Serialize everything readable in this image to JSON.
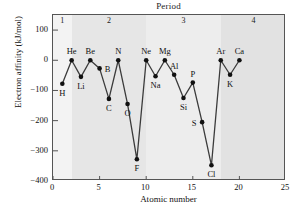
{
  "chart_data": {
    "type": "line",
    "title": "Period",
    "xlabel": "Atomic number",
    "ylabel": "Electron affinity (kJ/mol)",
    "xlim": [
      0,
      25
    ],
    "ylim": [
      -400,
      150
    ],
    "grid": false,
    "legend": null,
    "xticks": [
      "0",
      "5",
      "10",
      "15",
      "20",
      "25"
    ],
    "xtick_values": [
      0,
      5,
      10,
      15,
      20,
      25
    ],
    "yticks": [
      "100",
      "0",
      "−100",
      "−200",
      "−300",
      "−400"
    ],
    "ytick_values": [
      100,
      0,
      -100,
      -200,
      -300,
      -400
    ],
    "x": [
      1,
      2,
      3,
      4,
      5,
      6,
      7,
      8,
      9,
      10,
      11,
      12,
      13,
      14,
      15,
      16,
      17,
      18,
      19,
      20
    ],
    "values": [
      -78,
      0,
      -55,
      0,
      -27,
      -128,
      0,
      -145,
      -328,
      0,
      -53,
      0,
      -48,
      -125,
      -74,
      -205,
      -348,
      0,
      -48,
      0
    ],
    "point_labels": [
      "H",
      "He",
      "Li",
      "Be",
      "B",
      "C",
      "N",
      "O",
      "F",
      "Ne",
      "Na",
      "Mg",
      "Al",
      "Si",
      "P",
      "S",
      "Cl",
      "Ar",
      "K",
      "Ca"
    ],
    "label_positions": [
      "below",
      "above",
      "below",
      "above",
      "right",
      "below",
      "above",
      "below",
      "below",
      "above",
      "below",
      "above",
      "above",
      "below",
      "above",
      "left",
      "below",
      "above",
      "below",
      "above"
    ],
    "bands": [
      {
        "label": "1",
        "start": 0,
        "end": 2,
        "color": "#f3f3f3"
      },
      {
        "label": "2",
        "start": 2,
        "end": 10,
        "color": "#e6e6e6"
      },
      {
        "label": "3",
        "start": 10,
        "end": 18,
        "color": "#ededed"
      },
      {
        "label": "4",
        "start": 18,
        "end": 25,
        "color": "#e2e2e2"
      }
    ],
    "series_color": "#3b3b3b",
    "marker_color": "#111111"
  },
  "axis": {
    "xlabel": "Atomic number",
    "ylabel": "Electron affinity (kJ/mol)"
  },
  "header": {
    "period_title": "Period"
  }
}
